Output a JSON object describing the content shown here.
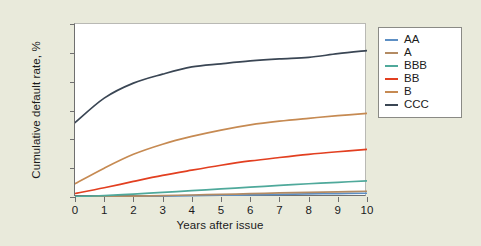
{
  "chart_data": {
    "type": "line",
    "title": "",
    "xlabel": "Years after issue",
    "ylabel": "Cumulative default rate, %",
    "xlim": [
      0,
      10
    ],
    "ylim": [
      0,
      60
    ],
    "xticks": [
      "0",
      "1",
      "2",
      "3",
      "4",
      "5",
      "6",
      "7",
      "8",
      "9",
      "10"
    ],
    "yticks": [
      "0",
      "10",
      "20",
      "30",
      "40",
      "50",
      "60"
    ],
    "grid": false,
    "legend_position": "right",
    "x": [
      0,
      1,
      2,
      3,
      4,
      5,
      6,
      7,
      8,
      9,
      10
    ],
    "series": [
      {
        "name": "AA",
        "color": "#5d8fc4",
        "values": [
          0.0,
          0.05,
          0.15,
          0.3,
          0.45,
          0.6,
          0.75,
          0.9,
          1.05,
          1.2,
          1.3
        ]
      },
      {
        "name": "A",
        "color": "#b38b63",
        "values": [
          0.05,
          0.15,
          0.3,
          0.5,
          0.7,
          0.9,
          1.15,
          1.4,
          1.6,
          1.8,
          2.0
        ]
      },
      {
        "name": "BBB",
        "color": "#4fa99b",
        "values": [
          0.1,
          0.5,
          1.0,
          1.6,
          2.2,
          2.8,
          3.4,
          4.0,
          4.6,
          5.1,
          5.6
        ]
      },
      {
        "name": "BB",
        "color": "#e23f20",
        "values": [
          1.2,
          3.2,
          5.4,
          7.5,
          9.3,
          11.0,
          12.5,
          13.7,
          14.8,
          15.7,
          16.5
        ]
      },
      {
        "name": "B",
        "color": "#c68a52",
        "values": [
          4.6,
          10.0,
          14.8,
          18.3,
          21.0,
          23.2,
          25.0,
          26.3,
          27.3,
          28.2,
          29.0
        ]
      },
      {
        "name": "CCC",
        "color": "#3a4654",
        "values": [
          25.8,
          34.3,
          39.5,
          42.6,
          45.1,
          46.2,
          47.2,
          47.9,
          48.4,
          49.7,
          50.8
        ]
      }
    ]
  },
  "legend": {
    "items": [
      {
        "label": "AA",
        "color": "#5d8fc4"
      },
      {
        "label": "A",
        "color": "#b38b63"
      },
      {
        "label": "BBB",
        "color": "#4fa99b"
      },
      {
        "label": "BB",
        "color": "#e23f20"
      },
      {
        "label": "B",
        "color": "#c68a52"
      },
      {
        "label": "CCC",
        "color": "#3a4654"
      }
    ]
  },
  "colors": {
    "background": "#e9eadb",
    "plot_background": "#ffffff",
    "axis": "#6f6f6f",
    "text": "#1b1b1b"
  }
}
